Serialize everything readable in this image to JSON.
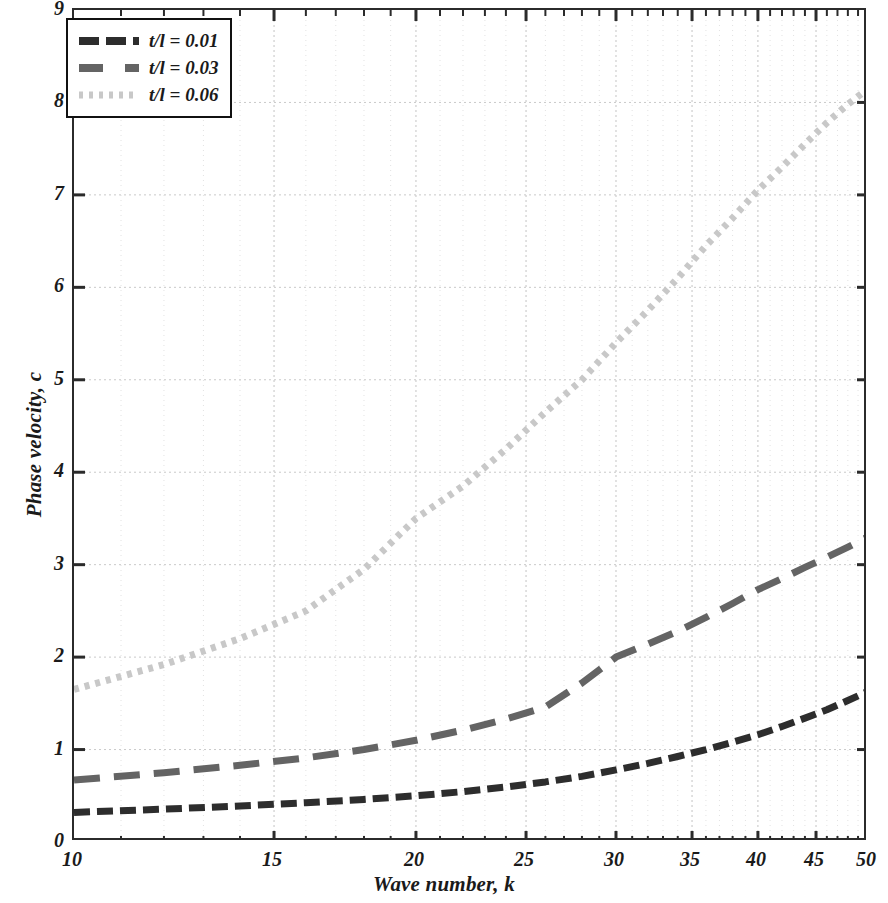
{
  "chart_data": {
    "type": "line",
    "title": "",
    "xlabel": "Wave number, k",
    "ylabel": "Phase velocity, c",
    "xscale": "log",
    "yscale": "linear",
    "xlim": [
      10,
      50
    ],
    "ylim": [
      0,
      9
    ],
    "grid": true,
    "legend_position": "top-left",
    "xticks": [
      10,
      15,
      20,
      25,
      30,
      35,
      40,
      45,
      50
    ],
    "xtick_labels": [
      "10",
      "15",
      "20",
      "25",
      "30",
      "35",
      "40",
      "45",
      "50"
    ],
    "yticks": [
      0,
      1,
      2,
      3,
      4,
      5,
      6,
      7,
      8,
      9
    ],
    "ytick_labels": [
      "0",
      "1",
      "2",
      "3",
      "4",
      "5",
      "6",
      "7",
      "8",
      "9"
    ],
    "x": [
      10,
      12,
      14,
      16,
      18,
      20,
      22,
      24,
      26,
      28,
      30,
      32,
      34,
      36,
      38,
      40,
      42,
      44,
      46,
      48,
      50
    ],
    "series": [
      {
        "name": "t/l = 0.01",
        "label": "t/l = 0.01",
        "color": "#2d2d2d",
        "style": "dashed",
        "dasharray": "16,7",
        "width": 7,
        "values": [
          0.32,
          0.355,
          0.39,
          0.425,
          0.46,
          0.5,
          0.545,
          0.595,
          0.65,
          0.71,
          0.78,
          0.85,
          0.925,
          1.0,
          1.08,
          1.16,
          1.25,
          1.34,
          1.43,
          1.53,
          1.63
        ]
      },
      {
        "name": "t/l = 0.03",
        "label": "t/l = 0.03",
        "color": "#646464",
        "style": "dashed",
        "dasharray": "26,14",
        "width": 7,
        "values": [
          0.67,
          0.75,
          0.83,
          0.91,
          1.0,
          1.1,
          1.21,
          1.33,
          1.46,
          1.72,
          2.0,
          2.14,
          2.28,
          2.43,
          2.58,
          2.73,
          2.85,
          2.97,
          3.08,
          3.19,
          3.3
        ]
      },
      {
        "name": "t/l = 0.06",
        "label": "t/l = 0.06",
        "color": "#c8c8c8",
        "style": "dotted",
        "dasharray": "5,6",
        "width": 7,
        "values": [
          1.65,
          1.92,
          2.2,
          2.5,
          2.95,
          3.5,
          3.85,
          4.25,
          4.65,
          5.0,
          5.4,
          5.75,
          6.1,
          6.45,
          6.75,
          7.05,
          7.3,
          7.55,
          7.78,
          7.98,
          8.15
        ]
      }
    ]
  },
  "legend": {
    "items": [
      {
        "label": "t/l = 0.01"
      },
      {
        "label": "t/l = 0.03"
      },
      {
        "label": "t/l = 0.06"
      }
    ]
  }
}
